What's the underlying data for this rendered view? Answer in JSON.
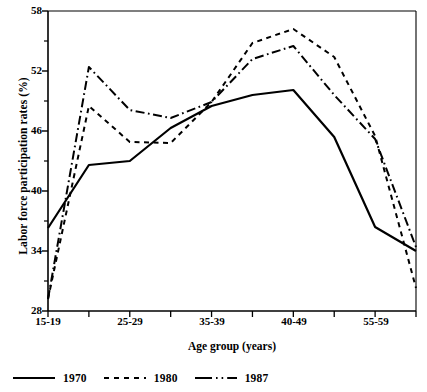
{
  "chart_data": {
    "type": "line",
    "title": "",
    "xlabel": "Age group (years)",
    "ylabel": "Labor force participation rates (%)",
    "ylim": [
      28,
      58
    ],
    "yticks": [
      28,
      34,
      40,
      46,
      52,
      58
    ],
    "yticklabels": [
      "28",
      "34",
      "40",
      "46",
      "52",
      "58"
    ],
    "y_minor_ticks": [
      31,
      37,
      43,
      49,
      55
    ],
    "grid": false,
    "legend_position": "below-axes-left",
    "categories": [
      "15-19",
      "20-24",
      "25-29",
      "30-34",
      "35-39",
      "40-44",
      "40-49",
      "50-54",
      "55-59",
      "60-64"
    ],
    "xticklabels_shown": [
      "15-19",
      "",
      "25-29",
      "",
      "35-39",
      "",
      "40-49",
      "",
      "55-59",
      ""
    ],
    "series": [
      {
        "name": "1970",
        "style": "solid",
        "values": [
          36.3,
          42.6,
          43.0,
          46.3,
          48.5,
          49.6,
          50.1,
          45.4,
          36.4,
          34.0
        ]
      },
      {
        "name": "1980",
        "style": "dotted",
        "values": [
          29.2,
          48.5,
          44.9,
          44.8,
          48.9,
          54.8,
          56.2,
          53.4,
          45.5,
          30.3
        ]
      },
      {
        "name": "1987",
        "style": "dash-dot",
        "values": [
          29.2,
          52.4,
          48.1,
          47.3,
          48.9,
          53.2,
          54.5,
          49.6,
          45.2,
          34.4
        ]
      }
    ]
  },
  "axes": {
    "y_title": "Labor force participation rates (%)",
    "x_title": "Age group (years)",
    "y_tick_labels": [
      "58",
      "52",
      "46",
      "40",
      "34",
      "28"
    ],
    "x_tick_labels": [
      "15-19",
      "25-29",
      "35-39",
      "40-49",
      "55-59"
    ]
  },
  "legend": {
    "items": [
      {
        "label": "1970",
        "style": "solid"
      },
      {
        "label": "1980",
        "style": "dotted"
      },
      {
        "label": "1987",
        "style": "dash-dot"
      }
    ]
  }
}
